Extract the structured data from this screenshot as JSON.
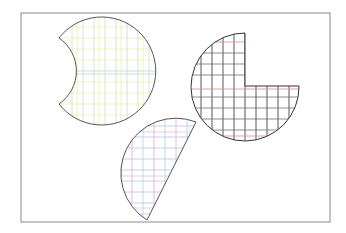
{
  "canvas": {
    "width": 346,
    "height": 233,
    "background": "#ffffff"
  },
  "frame": {
    "x": 21,
    "y": 13,
    "width": 309,
    "height": 209,
    "stroke": "#8a8a8a"
  },
  "shapes": [
    {
      "id": "shape-bitten-circle",
      "description": "circle with concave bite on left side",
      "outline": "#555555",
      "grid_colors": {
        "vertical": "#bcd8cf",
        "horizontal": "#e8eaa0",
        "accent": "#9fc6d8"
      },
      "grid_step": 11
    },
    {
      "id": "shape-three-quarter-circle",
      "description": "circle with top-right quadrant removed",
      "outline": "#333333",
      "grid_colors": {
        "vertical": "#3a3a3a",
        "horizontal": "#6b6b6b",
        "accent": "#d98080"
      },
      "grid_step": 11
    },
    {
      "id": "shape-half-disk",
      "description": "half disk cut along tilted diameter",
      "outline": "#555555",
      "grid_colors": {
        "vertical": "#e4a8c0",
        "horizontal": "#a8d4e0",
        "accent": "#b8b8e8"
      },
      "grid_step": 11
    }
  ]
}
